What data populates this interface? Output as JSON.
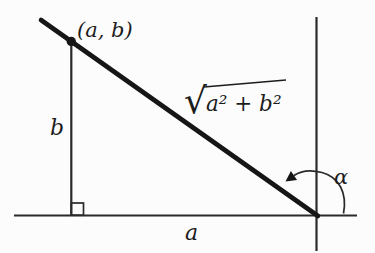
{
  "figure": {
    "colors": {
      "background": "#fcfcfc",
      "ink": "#2a2a2a",
      "bold_ink": "#161616",
      "text_ink": "#1c1c1c"
    },
    "labels": {
      "point": "(a, b)",
      "radical_sign": "√",
      "radical_expression": "a² + b²",
      "side_b": "b",
      "side_a": "a",
      "angle": "α"
    }
  }
}
